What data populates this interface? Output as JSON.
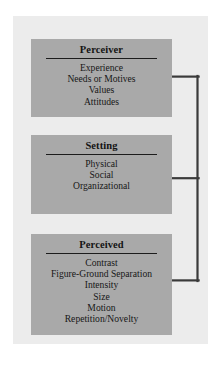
{
  "diagram": {
    "type": "hierarchy-bracket",
    "background_color": "#ffffff",
    "panel_color": "#ececec",
    "box_color": "#a9a9a9",
    "line_color": "#3a3a3a",
    "nodes": [
      {
        "id": "perceiver",
        "title": "Perceiver",
        "items": [
          "Experience",
          "Needs or Motives",
          "Values",
          "Attitudes"
        ]
      },
      {
        "id": "setting",
        "title": "Setting",
        "items": [
          "Physical",
          "Social",
          "Organizational"
        ]
      },
      {
        "id": "perceived",
        "title": "Perceived",
        "items": [
          "Contrast",
          "Figure-Ground Separation",
          "Intensity",
          "Size",
          "Motion",
          "Repetition/Novelty"
        ]
      }
    ],
    "connector": {
      "description": "Bracket joining the right edge of all three boxes into a single vertical spine",
      "spine_x": 198,
      "branch_y": [
        76,
        178,
        281
      ],
      "box_right_x": 172
    }
  }
}
